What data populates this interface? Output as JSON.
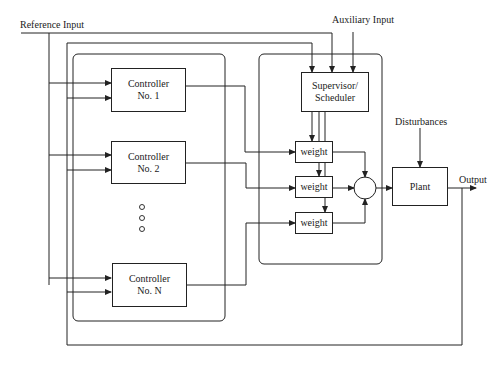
{
  "diagram": {
    "type": "multiple-controller block diagram",
    "inputs": {
      "reference": "Reference Input",
      "auxiliary": "Auxiliary Input",
      "disturbances": "Disturbances"
    },
    "output": "Output",
    "controllers": [
      {
        "line1": "Controller",
        "line2": "No. 1"
      },
      {
        "line1": "Controller",
        "line2": "No. 2"
      },
      {
        "line1": "Controller",
        "line2": "No. N"
      }
    ],
    "supervisor": {
      "line1": "Supervisor/",
      "line2": "Scheduler"
    },
    "weights": [
      {
        "label": "weight"
      },
      {
        "label": "weight"
      },
      {
        "label": "weight"
      }
    ],
    "plant": "Plant",
    "ellipsis_dots": 3,
    "line_color": "#222222"
  }
}
